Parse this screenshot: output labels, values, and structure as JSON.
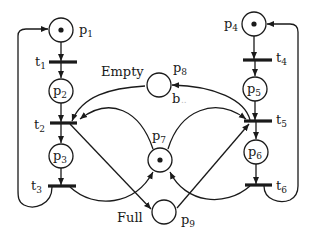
{
  "diagram": {
    "type": "petri-net",
    "places": [
      {
        "id": "p1",
        "label": "p",
        "sub": "1",
        "tokens": 1
      },
      {
        "id": "p2",
        "label": "p",
        "sub": "2",
        "tokens": 0
      },
      {
        "id": "p3",
        "label": "p",
        "sub": "3",
        "tokens": 0
      },
      {
        "id": "p4",
        "label": "p",
        "sub": "4",
        "tokens": 1
      },
      {
        "id": "p5",
        "label": "p",
        "sub": "5",
        "tokens": 0
      },
      {
        "id": "p6",
        "label": "p",
        "sub": "6",
        "tokens": 0
      },
      {
        "id": "p7",
        "label": "p",
        "sub": "7",
        "tokens": 1
      },
      {
        "id": "p8",
        "label": "p",
        "sub": "8",
        "tokens": 0
      },
      {
        "id": "p9",
        "label": "p",
        "sub": "9",
        "tokens": 0
      }
    ],
    "transitions": [
      {
        "id": "t1",
        "label": "t",
        "sub": "1"
      },
      {
        "id": "t2",
        "label": "t",
        "sub": "2"
      },
      {
        "id": "t3",
        "label": "t",
        "sub": "3"
      },
      {
        "id": "t4",
        "label": "t",
        "sub": "4"
      },
      {
        "id": "t5",
        "label": "t",
        "sub": "5"
      },
      {
        "id": "t6",
        "label": "t",
        "sub": "6"
      }
    ],
    "arcs": [
      [
        "p1",
        "t1"
      ],
      [
        "t1",
        "p2"
      ],
      [
        "p2",
        "t2"
      ],
      [
        "t2",
        "p3"
      ],
      [
        "p3",
        "t3"
      ],
      [
        "t3",
        "p1"
      ],
      [
        "p4",
        "t4"
      ],
      [
        "t4",
        "p5"
      ],
      [
        "p5",
        "t5"
      ],
      [
        "t5",
        "p6"
      ],
      [
        "p6",
        "t6"
      ],
      [
        "t6",
        "p4"
      ],
      [
        "p8",
        "t2"
      ],
      [
        "t5",
        "p8"
      ],
      [
        "p7",
        "t2"
      ],
      [
        "p7",
        "t5"
      ],
      [
        "t2",
        "p9"
      ],
      [
        "p9",
        "t5"
      ],
      [
        "t3",
        "p7"
      ],
      [
        "t6",
        "p7"
      ]
    ],
    "annotations": {
      "empty": "Empty",
      "full": "Full",
      "b": "b",
      "b_dots": ".."
    }
  }
}
